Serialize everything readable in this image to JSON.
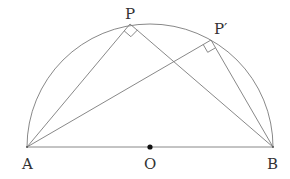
{
  "diagram": {
    "type": "semicircle-inscribed-right-angles",
    "points": {
      "A": {
        "label": "A",
        "x": 27,
        "y": 147
      },
      "B": {
        "label": "B",
        "x": 273,
        "y": 147
      },
      "O": {
        "label": "O",
        "x": 150,
        "y": 147
      },
      "P": {
        "label": "P",
        "x": 130,
        "y": 24
      },
      "P_prime": {
        "label": "P′",
        "x": 211,
        "y": 40
      }
    },
    "segments": [
      "AB",
      "AP",
      "PB",
      "AP′",
      "P′B"
    ],
    "right_angle_marks": [
      "P",
      "P′"
    ],
    "arc": {
      "center": "O",
      "radius": 123,
      "from": "A",
      "to": "B"
    },
    "colors": {
      "stroke": "#7a7a7a",
      "text": "#333333",
      "center_dot": "#111111"
    }
  }
}
